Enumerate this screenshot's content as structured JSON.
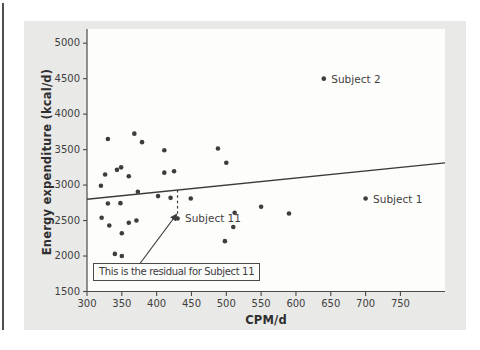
{
  "chart_data": {
    "type": "scatter",
    "xlabel": "CPM/d",
    "ylabel": "Energy expenditure (kcal/d)",
    "xlim": [
      300,
      814
    ],
    "ylim": [
      1500,
      5200
    ],
    "x_ticks": [
      300,
      350,
      400,
      450,
      500,
      550,
      600,
      650,
      700,
      750
    ],
    "y_ticks": [
      1500,
      2000,
      2500,
      3000,
      3500,
      4000,
      4500,
      5000
    ],
    "grid": false,
    "legend": "none",
    "points": [
      [
        330,
        3650
      ],
      [
        368,
        3725
      ],
      [
        379,
        3605
      ],
      [
        411,
        3490
      ],
      [
        488,
        3515
      ],
      [
        500,
        3315
      ],
      [
        326,
        3150
      ],
      [
        343,
        3215
      ],
      [
        349,
        3250
      ],
      [
        360,
        3125
      ],
      [
        411,
        3175
      ],
      [
        425,
        3195
      ],
      [
        320,
        2990
      ],
      [
        373,
        2905
      ],
      [
        402,
        2845
      ],
      [
        420,
        2820
      ],
      [
        449,
        2810
      ],
      [
        330,
        2740
      ],
      [
        348,
        2745
      ],
      [
        321,
        2540
      ],
      [
        332,
        2430
      ],
      [
        360,
        2470
      ],
      [
        371,
        2500
      ],
      [
        350,
        2320
      ],
      [
        498,
        2210
      ],
      [
        510,
        2410
      ],
      [
        512,
        2610
      ],
      [
        550,
        2695
      ],
      [
        590,
        2600
      ],
      [
        340,
        2030
      ],
      [
        350,
        2000
      ]
    ],
    "labeled_points": [
      {
        "label": "Subject 2",
        "x": 640,
        "y": 4500
      },
      {
        "label": "Subject 1",
        "x": 700,
        "y": 2810
      },
      {
        "label": "Subject 11",
        "x": 430,
        "y": 2530
      }
    ],
    "trend_line": {
      "x1": 300,
      "y1": 2800,
      "x2": 814,
      "y2": 3312
    },
    "residual_line": {
      "x": 430,
      "y_from": 2930,
      "y_to": 2550,
      "style": "dashed"
    },
    "annotation": {
      "text": "This is the residual for Subject 11",
      "points_to": "Subject 11"
    },
    "colors": {
      "point": "#3d3d3d",
      "trend_line": "#3a3a3a",
      "axis": "#4a4a4a",
      "text": "#3f3f3f",
      "card_bg": "#e9e9e7",
      "plot_bg": "#fdfdfc"
    }
  }
}
